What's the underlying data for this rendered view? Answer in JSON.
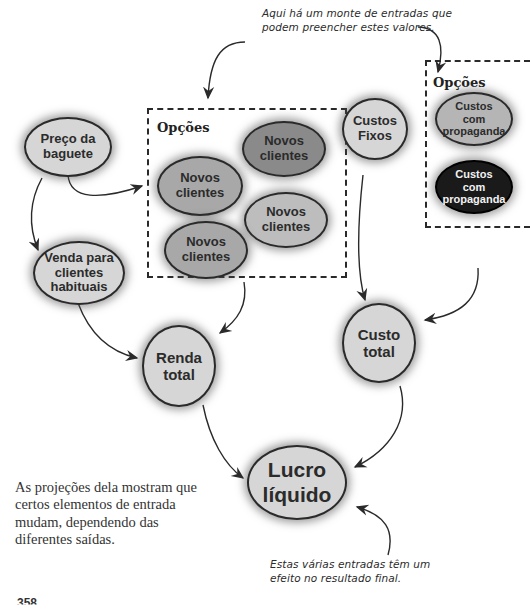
{
  "annotations": {
    "top": [
      "Aqui há um monte de entradas que",
      "podem preencher estes valores."
    ],
    "bottom": [
      "Estas várias entradas têm um",
      "efeito no resultado final."
    ]
  },
  "caption": [
    "As projeções dela mostram que",
    "certos elementos de entrada",
    "mudam, dependendo das",
    "diferentes saídas."
  ],
  "options_box_left": {
    "title": "Opções",
    "nodes": [
      "Novos clientes",
      "Novos clientes",
      "Novos clientes",
      "Novos clientes"
    ]
  },
  "options_box_right": {
    "title": "Opções",
    "nodes": [
      "Custos com propaganda",
      "Custos com propaganda"
    ]
  },
  "nodes": {
    "preco_baguete": [
      "Preço da",
      "baguete"
    ],
    "venda_habituais": [
      "Venda para",
      "clientes",
      "habituais"
    ],
    "custos_fixos": [
      "Custos",
      "Fixos"
    ],
    "renda_total": [
      "Renda",
      "total"
    ],
    "custo_total": [
      "Custo",
      "total"
    ],
    "lucro_liquido": [
      "Lucro",
      "líquido"
    ]
  },
  "left_box_nodes": [
    [
      "Novos",
      "clientes"
    ],
    [
      "Novos",
      "clientes"
    ],
    [
      "Novos",
      "clientes"
    ],
    [
      "Novos",
      "clientes"
    ]
  ],
  "right_box_nodes": [
    [
      "Custos",
      "com",
      "propaganda"
    ],
    [
      "Custos",
      "com",
      "propaganda"
    ]
  ],
  "page_number": "358",
  "colors": {
    "node_light": "#d6d6d6",
    "node_mid": "#8a8a8a",
    "node_dark": "#1a1a1a",
    "stroke": "#2a2a2a"
  }
}
